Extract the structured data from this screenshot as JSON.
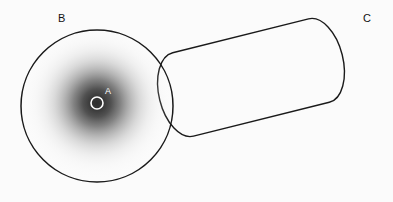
{
  "figure": {
    "title": "",
    "background_color": "#fbfbfb",
    "stroke_color": "#1a1a1a",
    "marker_color": "#ffffff",
    "gradient_core_color": "#3a3a3a",
    "gradient_edge_color": "#fbfbfb"
  },
  "labels": {
    "a": "A",
    "b": "B",
    "c": "C"
  },
  "shapes": {
    "point_a": {
      "name": "A",
      "type": "circle-marker",
      "cx": 97,
      "cy": 103,
      "r": 6,
      "stroke": "#ffffff",
      "fill": "none"
    },
    "region_b": {
      "name": "B",
      "type": "circle",
      "cx": 97,
      "cy": 106,
      "r": 76,
      "stroke": "#1a1a1a",
      "fill": "none"
    },
    "region_c": {
      "name": "C",
      "type": "capsule",
      "stroke": "#1a1a1a",
      "fill": "none",
      "cap_left_cx": 157,
      "cap_left_cy": 101,
      "cap_right_cx": 345,
      "cap_right_cy": 54,
      "cap_rx": 24,
      "cap_ry": 43
    },
    "gradient_field": {
      "name": "density-field",
      "type": "radial-gradient",
      "cx": 97,
      "cy": 103,
      "r": 76
    }
  },
  "label_positions": {
    "a": {
      "x": 105,
      "y": 94
    },
    "b": {
      "x": 58,
      "y": 22
    },
    "c": {
      "x": 363,
      "y": 22
    }
  }
}
